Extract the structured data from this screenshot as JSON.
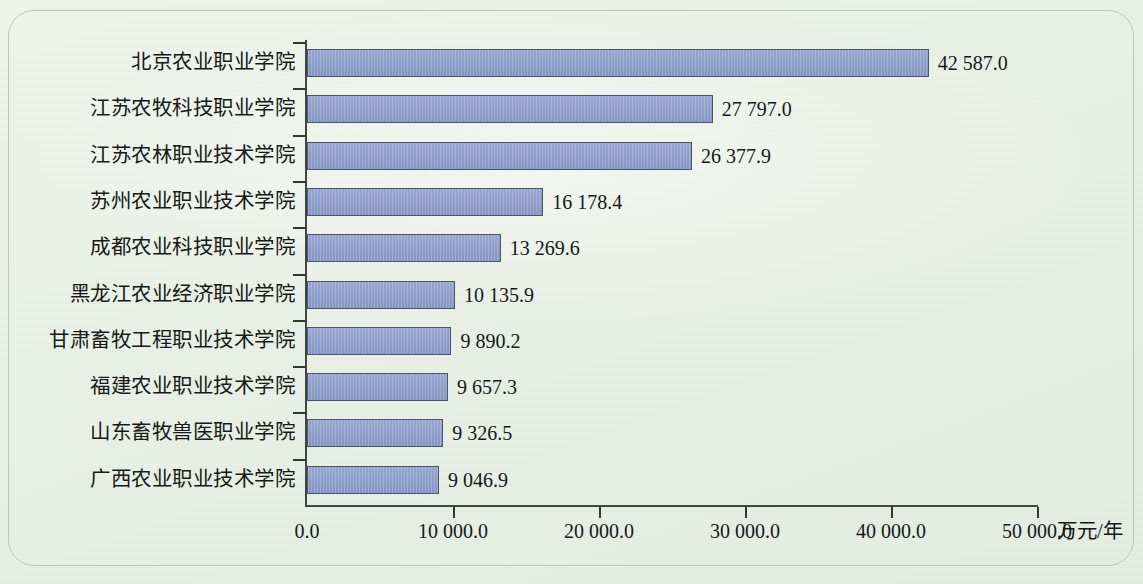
{
  "chart_data": {
    "type": "bar",
    "orientation": "horizontal",
    "title": "",
    "xlabel": "万元/年",
    "ylabel": "",
    "xlim": [
      0,
      50000
    ],
    "grid": false,
    "legend": null,
    "xticks": [
      "0.0",
      "10 000.0",
      "20 000.0",
      "30 000.0",
      "40 000.0",
      "50 000.0"
    ],
    "xtick_values": [
      0,
      10000,
      20000,
      30000,
      40000,
      50000
    ],
    "categories": [
      "北京农业职业学院",
      "江苏农牧科技职业学院",
      "江苏农林职业技术学院",
      "苏州农业职业技术学院",
      "成都农业科技职业学院",
      "黑龙江农业经济职业学院",
      "甘肃畜牧工程职业技术学院",
      "福建农业职业技术学院",
      "山东畜牧兽医职业学院",
      "广西农业职业技术学院"
    ],
    "values": [
      42587.0,
      27797.0,
      26377.9,
      16178.4,
      13269.6,
      10135.9,
      9890.2,
      9657.3,
      9326.5,
      9046.9
    ],
    "value_labels": [
      "42 587.0",
      "27 797.0",
      "26 377.9",
      "16 178.4",
      "13 269.6",
      "10 135.9",
      "9 890.2",
      "9 657.3",
      "9 326.5",
      "9 046.9"
    ],
    "colors": {
      "bar_fill": "#8d9cc8",
      "bar_border": "#4a5468",
      "axis": "#3f4840",
      "text": "#15181a",
      "background": "#e9f1e6"
    }
  }
}
